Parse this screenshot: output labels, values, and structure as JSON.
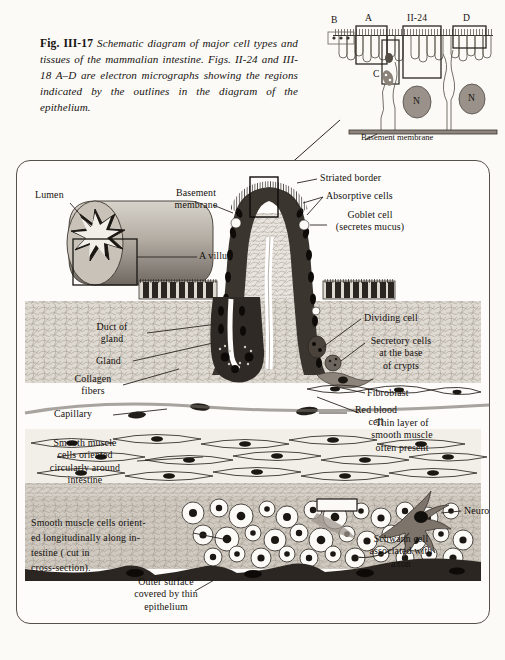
{
  "figure": {
    "number": "Fig. III-17",
    "caption": "Schematic diagram of major cell types and tissues of the mammalian intestine. Figs. II-24 and III-18 A–D are electron micrographs showing the regions indicated by the outlines in the diagram of the epithelium."
  },
  "inset": {
    "name": "epithelium-detail-inset",
    "region_labels": [
      "B",
      "A",
      "II-24",
      "D",
      "C"
    ],
    "nucleus_labels": [
      "N",
      "N"
    ],
    "basement_membrane_label": "Basement membrane"
  },
  "diagram": {
    "cross_section": {
      "lumen_label": "Lumen",
      "villus_label": "A villus"
    },
    "labels": {
      "basement_membrane": "Basement\nmembrane",
      "striated_border": "Striated border",
      "absorptive_cells": "Absorptive cells",
      "goblet_cell": "Goblet cell\n(secretes mucus)",
      "dividing_cell": "Dividing cell",
      "secretory_cells": "Secretory cells\nat the base\nof crypts",
      "duct_of_gland": "Duct of\ngland",
      "gland": "Gland",
      "collagen_fibers": "Collagen\nfibers",
      "capillary": "Capillary",
      "thin_layer_muscle": "Thin layer of\nsmooth muscle\noften present",
      "fibroblast": "Fibroblast",
      "red_blood_cell": "Red blood\ncell",
      "circular_muscle": "Smooth muscle\ncells oriented\ncircularly around\nintestine",
      "longitudinal_muscle": "Smooth muscle cells orient-\ned longitudinally along in-\ntestine ( cut in\ncross-section).",
      "neuron": "Neuron",
      "schwann_cell": "Schwann cell\nassociated with\naxon",
      "outer_surface": "Outer surface\ncovered by thin\nepithelium"
    }
  },
  "colors": {
    "page_background": "#fbfaf7",
    "ink": "#171310",
    "epithelium_dark": "#3b3530",
    "connective_tissue": "#cfc9c0",
    "muscle_fill": "#f2efe9",
    "nucleus": "#26211d",
    "border": "#55504a"
  }
}
